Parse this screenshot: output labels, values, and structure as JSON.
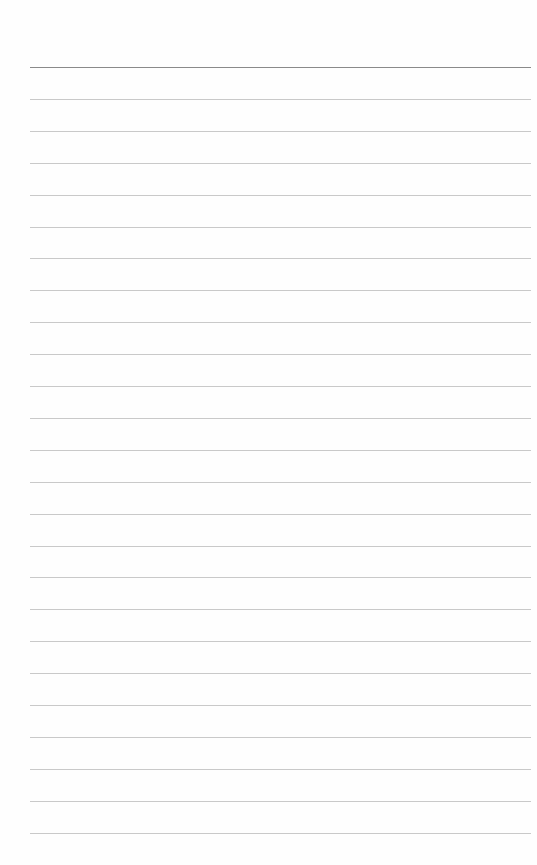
{
  "page": {
    "type": "lined-notebook-page",
    "background_color": "#fefefe",
    "line_color": "#c9c9c9",
    "top_line_color": "#8a8a8a",
    "line_count": 25,
    "first_line_y": 67,
    "line_spacing": 31.9,
    "left_margin": 30,
    "text": ""
  }
}
